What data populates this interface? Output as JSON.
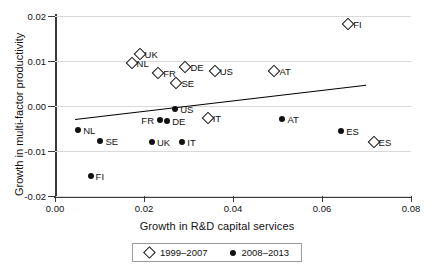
{
  "chart_data": {
    "type": "scatter",
    "title": "",
    "xlabel": "Growth in R&D capital services",
    "ylabel": "Growth in multi-factor productivity",
    "xlim": [
      0.0,
      0.08
    ],
    "ylim": [
      -0.02,
      0.02
    ],
    "xticks": [
      "0.00",
      "0.02",
      "0.04",
      "0.06",
      "0.08"
    ],
    "xtick_values": [
      0.0,
      0.02,
      0.04,
      0.06,
      0.08
    ],
    "yticks": [
      "0.02",
      "0.01",
      "0.00",
      "-0.01",
      "-0.02"
    ],
    "ytick_values": [
      0.02,
      0.01,
      0.0,
      -0.01,
      -0.02
    ],
    "grid": true,
    "legend_position": "bottom",
    "series": [
      {
        "name": "1999-2007",
        "marker": "hollow-diamond",
        "color": "#111111",
        "points": [
          {
            "label": "UK",
            "x": 0.019,
            "y": 0.01145,
            "label_side": "right"
          },
          {
            "label": "NL",
            "x": 0.0172,
            "y": 0.0096,
            "label_side": "right"
          },
          {
            "label": "FR",
            "x": 0.0232,
            "y": 0.0074,
            "label_side": "right"
          },
          {
            "label": "DE",
            "x": 0.0293,
            "y": 0.0087,
            "label_side": "right"
          },
          {
            "label": "SE",
            "x": 0.0273,
            "y": 0.0052,
            "label_side": "right"
          },
          {
            "label": "US",
            "x": 0.0359,
            "y": 0.0078,
            "label_side": "right"
          },
          {
            "label": "AT",
            "x": 0.0493,
            "y": 0.0078,
            "label_side": "right"
          },
          {
            "label": "FI",
            "x": 0.0659,
            "y": 0.0183,
            "label_side": "right"
          },
          {
            "label": "IT",
            "x": 0.0343,
            "y": -0.0027,
            "label_side": "right"
          },
          {
            "label": "ES",
            "x": 0.0716,
            "y": -0.0079,
            "label_side": "right"
          }
        ]
      },
      {
        "name": "2008-2013",
        "marker": "filled-circle",
        "color": "#111111",
        "points": [
          {
            "label": "NL",
            "x": 0.0052,
            "y": -0.0053,
            "label_side": "right"
          },
          {
            "label": "SE",
            "x": 0.0102,
            "y": -0.0077,
            "label_side": "right"
          },
          {
            "label": "FI",
            "x": 0.008,
            "y": -0.0156,
            "label_side": "right"
          },
          {
            "label": "UK",
            "x": 0.0218,
            "y": -0.0081,
            "label_side": "right"
          },
          {
            "label": "IT",
            "x": 0.0286,
            "y": -0.0081,
            "label_side": "right"
          },
          {
            "label": "FR",
            "x": 0.0236,
            "y": -0.0032,
            "label_side": "left"
          },
          {
            "label": "DE",
            "x": 0.0252,
            "y": -0.0033,
            "label_side": "right"
          },
          {
            "label": "US",
            "x": 0.027,
            "y": -0.0007,
            "label_side": "right"
          },
          {
            "label": "AT",
            "x": 0.0511,
            "y": -0.0029,
            "label_side": "right"
          },
          {
            "label": "ES",
            "x": 0.0643,
            "y": -0.0055,
            "label_side": "right"
          }
        ]
      }
    ],
    "trendline": {
      "x0": 0.0046,
      "y0": -0.0028,
      "x1": 0.07,
      "y1": 0.0048
    }
  },
  "legend": {
    "items": [
      {
        "marker": "hollow-diamond",
        "label": "1999–2007"
      },
      {
        "marker": "filled-circle",
        "label": "2008–2013"
      }
    ]
  }
}
